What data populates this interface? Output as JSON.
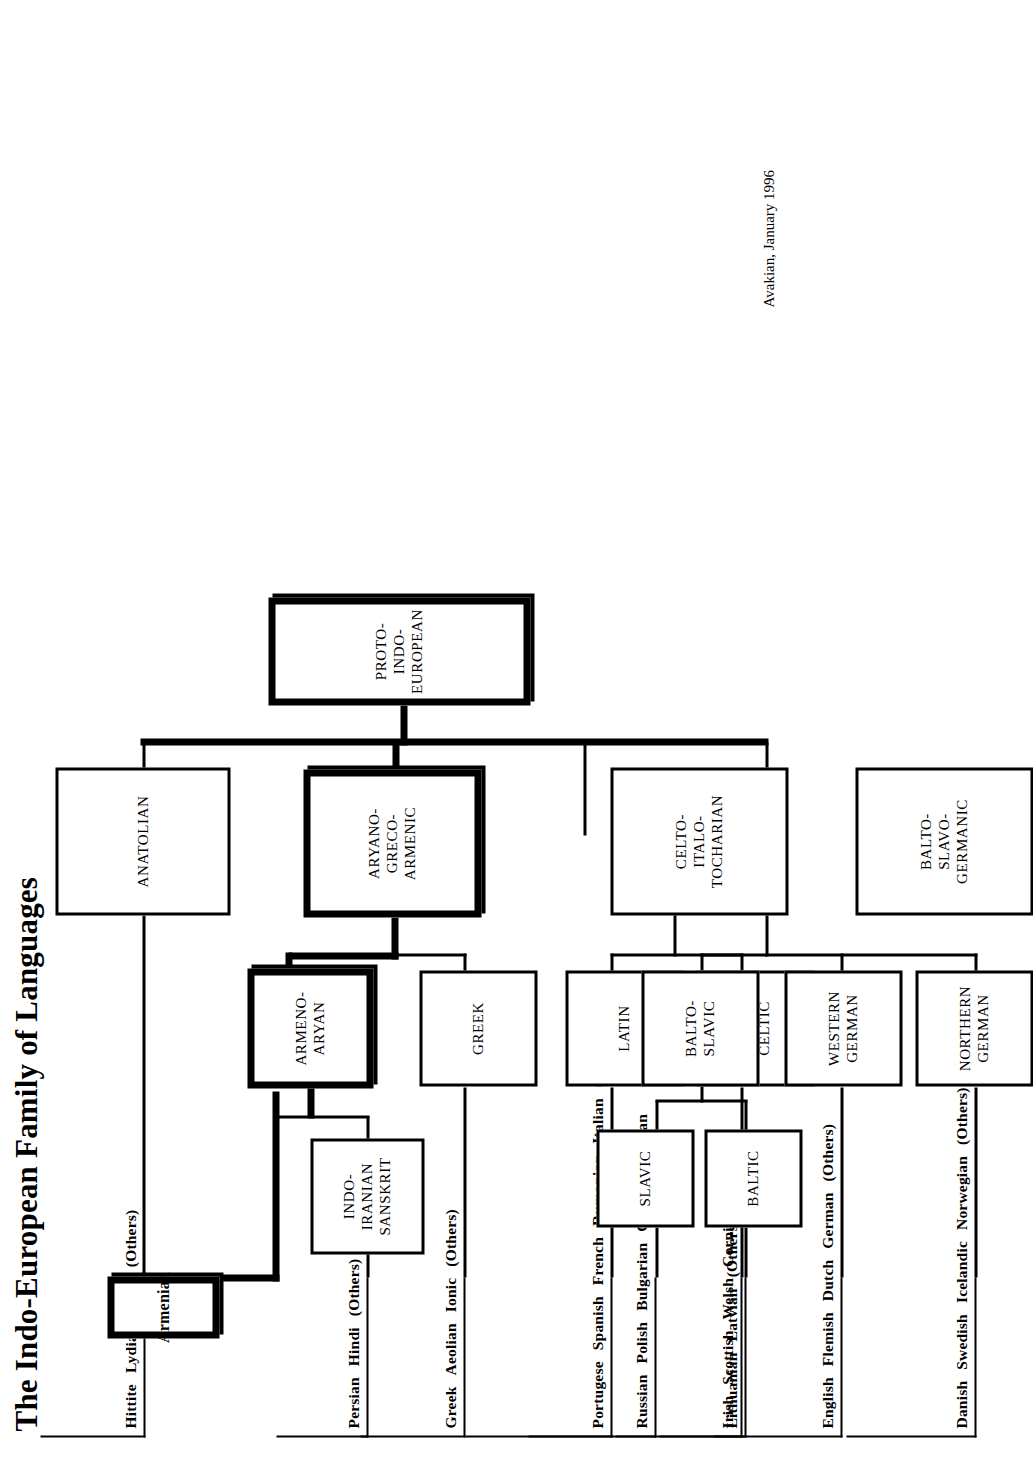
{
  "title": "The Indo-European Family of Languages",
  "credit": "Avakian, January 1996",
  "chart_data": {
    "type": "diagram",
    "subtype": "tree",
    "title": "The Indo-European Family of Languages",
    "root": "PROTO-INDO-EUROPEAN",
    "orientation": "rotated-90-ccw"
  },
  "nodes": {
    "proto_indo_european": {
      "label": "PROTO-INDO-EUROPEAN",
      "emphasis": "thick"
    },
    "anatolian": {
      "label": "ANATOLIAN",
      "emphasis": "thin"
    },
    "aryano_greco_armenic": {
      "label": "ARYANO-\nGRECO-\nARMENIC",
      "emphasis": "thick"
    },
    "celto_italo_tocharian": {
      "label": "CELTO-\nITALO-\nTOCHARIAN",
      "emphasis": "thin"
    },
    "balto_slavo_germanic": {
      "label": "BALTO-\nSLAVO-\nGERMANIC",
      "emphasis": "thin"
    },
    "armeno_aryan": {
      "label": "ARMENO-\nARYAN",
      "emphasis": "thick"
    },
    "greek": {
      "label": "GREEK",
      "emphasis": "thin"
    },
    "armenian": {
      "label": "Armenian",
      "emphasis": "thick"
    },
    "indo_iranian_sanskrit": {
      "label": "INDO-\nIRANIAN\nSANSKRIT",
      "emphasis": "thin"
    },
    "latin": {
      "label": "LATIN",
      "emphasis": "thin"
    },
    "proto_celtic": {
      "label": "PROTO-\nCELTIC",
      "emphasis": "thin"
    },
    "balto_slavic": {
      "label": "BALTO-\nSLAVIC",
      "emphasis": "thin"
    },
    "baltic": {
      "label": "BALTIC",
      "emphasis": "thin"
    },
    "slavic": {
      "label": "SLAVIC",
      "emphasis": "thin"
    },
    "western_german": {
      "label": "WESTERN\nGERMAN",
      "emphasis": "thin"
    },
    "northern_german": {
      "label": "NORTHERN\nGERMAN",
      "emphasis": "thin"
    }
  },
  "leaf_groups": [
    {
      "id": "anatolian_langs",
      "parent": "ANATOLIAN",
      "items": [
        "Hittite",
        "Lydian",
        "Urdu",
        "(Others)"
      ]
    },
    {
      "id": "iranian_langs",
      "parent": "INDO-IRANIAN SANSKRIT",
      "items": [
        "Persian",
        "Hindi",
        "(Others)"
      ]
    },
    {
      "id": "greek_langs",
      "parent": "GREEK",
      "items": [
        "Greek",
        "Aeolian",
        "Ionic",
        "(Others)"
      ]
    },
    {
      "id": "latin_langs",
      "parent": "LATIN",
      "items": [
        "Portugese",
        "Spanish",
        "French",
        "Rumanian",
        "Italian",
        "(Others)"
      ]
    },
    {
      "id": "celtic_langs",
      "parent": "PROTO-CELTIC",
      "items": [
        "Irish",
        "Scottish",
        "Welsh",
        "Cornish",
        "(Others)"
      ]
    },
    {
      "id": "slavic_langs",
      "parent": "SLAVIC",
      "items": [
        "Russian",
        "Polish",
        "Bulgarian",
        "Czech",
        "Ukranian"
      ]
    },
    {
      "id": "baltic_langs",
      "parent": "BALTIC",
      "items": [
        "Lithuanian",
        "Latvian",
        "(Others)"
      ]
    },
    {
      "id": "wgerman_langs",
      "parent": "WESTERN GERMAN",
      "items": [
        "English",
        "Flemish",
        "Dutch",
        "German",
        "(Others)"
      ]
    },
    {
      "id": "ngerman_langs",
      "parent": "NORTHERN GERMAN",
      "items": [
        "Danish",
        "Swedish",
        "Icelandic",
        "Norwegian",
        "(Others)"
      ]
    }
  ],
  "edges": [
    {
      "from": "PROTO-INDO-EUROPEAN",
      "to": "ANATOLIAN"
    },
    {
      "from": "PROTO-INDO-EUROPEAN",
      "to": "ARYANO-GRECO-ARMENIC"
    },
    {
      "from": "PROTO-INDO-EUROPEAN",
      "to": "CELTO-ITALO-TOCHARIAN"
    },
    {
      "from": "PROTO-INDO-EUROPEAN",
      "to": "BALTO-SLAVO-GERMANIC"
    },
    {
      "from": "ARYANO-GRECO-ARMENIC",
      "to": "ARMENO-ARYAN"
    },
    {
      "from": "ARYANO-GRECO-ARMENIC",
      "to": "GREEK"
    },
    {
      "from": "ARMENO-ARYAN",
      "to": "Armenian"
    },
    {
      "from": "ARMENO-ARYAN",
      "to": "INDO-IRANIAN SANSKRIT"
    },
    {
      "from": "CELTO-ITALO-TOCHARIAN",
      "to": "LATIN"
    },
    {
      "from": "CELTO-ITALO-TOCHARIAN",
      "to": "PROTO-CELTIC"
    },
    {
      "from": "BALTO-SLAVO-GERMANIC",
      "to": "BALTO-SLAVIC"
    },
    {
      "from": "BALTO-SLAVO-GERMANIC",
      "to": "WESTERN GERMAN"
    },
    {
      "from": "BALTO-SLAVO-GERMANIC",
      "to": "NORTHERN GERMAN"
    },
    {
      "from": "BALTO-SLAVIC",
      "to": "SLAVIC"
    },
    {
      "from": "BALTO-SLAVIC",
      "to": "BALTIC"
    }
  ],
  "colors": {
    "ink": "#000000",
    "paper": "#ffffff"
  }
}
